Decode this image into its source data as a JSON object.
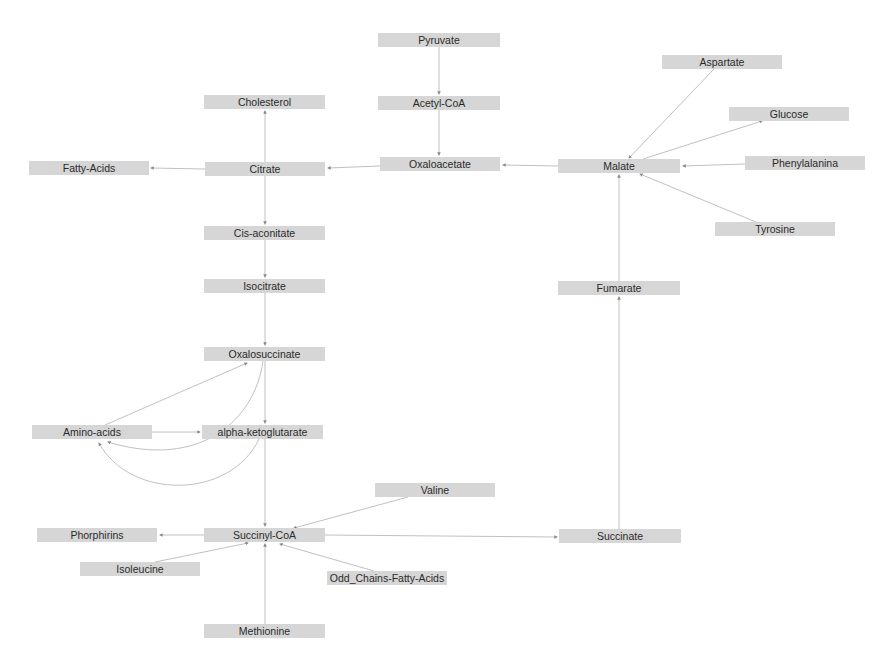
{
  "diagram": {
    "type": "metabolic-pathway-graph",
    "colors": {
      "node_fill": "#d6d6d6",
      "edge": "#b9b9b9",
      "text": "#2a2a2a",
      "background": "#ffffff"
    },
    "nodes": [
      {
        "id": "pyruvate",
        "label": "Pyruvate",
        "x": 378,
        "y": 33,
        "w": 122
      },
      {
        "id": "acetyl-coa",
        "label": "Acetyl-CoA",
        "x": 378,
        "y": 96,
        "w": 122
      },
      {
        "id": "oxaloacetate",
        "label": "Oxaloacetate",
        "x": 380,
        "y": 157,
        "w": 120
      },
      {
        "id": "cholesterol",
        "label": "Cholesterol",
        "x": 204,
        "y": 95,
        "w": 121
      },
      {
        "id": "citrate",
        "label": "Citrate",
        "x": 205,
        "y": 162,
        "w": 120
      },
      {
        "id": "fatty-acids",
        "label": "Fatty-Acids",
        "x": 29,
        "y": 161,
        "w": 120
      },
      {
        "id": "cis-aconitate",
        "label": "Cis-aconitate",
        "x": 204,
        "y": 226,
        "w": 121
      },
      {
        "id": "isocitrate",
        "label": "Isocitrate",
        "x": 204,
        "y": 279,
        "w": 121
      },
      {
        "id": "oxalosuccinate",
        "label": "Oxalosuccinate",
        "x": 204,
        "y": 347,
        "w": 121
      },
      {
        "id": "alpha-ketoglutarate",
        "label": "alpha-ketoglutarate",
        "x": 202,
        "y": 425,
        "w": 121
      },
      {
        "id": "amino-acids",
        "label": "Amino-acids",
        "x": 32,
        "y": 425,
        "w": 120
      },
      {
        "id": "succinyl-coa",
        "label": "Succinyl-CoA",
        "x": 204,
        "y": 528,
        "w": 121
      },
      {
        "id": "phorphirins",
        "label": "Phorphirins",
        "x": 37,
        "y": 528,
        "w": 120
      },
      {
        "id": "valine",
        "label": "Valine",
        "x": 375,
        "y": 483,
        "w": 120
      },
      {
        "id": "succinate",
        "label": "Succinate",
        "x": 559,
        "y": 529,
        "w": 122
      },
      {
        "id": "fumarate",
        "label": "Fumarate",
        "x": 558,
        "y": 281,
        "w": 122
      },
      {
        "id": "malate",
        "label": "Malate",
        "x": 558,
        "y": 159,
        "w": 122
      },
      {
        "id": "aspartate",
        "label": "Aspartate",
        "x": 662,
        "y": 55,
        "w": 120
      },
      {
        "id": "glucose",
        "label": "Glucose",
        "x": 729,
        "y": 107,
        "w": 120
      },
      {
        "id": "phenylalanina",
        "label": "Phenylalanina",
        "x": 745,
        "y": 156,
        "w": 120
      },
      {
        "id": "tyrosine",
        "label": "Tyrosine",
        "x": 715,
        "y": 222,
        "w": 120
      },
      {
        "id": "isoleucine",
        "label": "Isoleucine",
        "x": 80,
        "y": 562,
        "w": 120
      },
      {
        "id": "odd-chains-fatty-acids",
        "label": "Odd_Chains-Fatty-Acids",
        "x": 327,
        "y": 571,
        "w": 120
      },
      {
        "id": "methionine",
        "label": "Methionine",
        "x": 204,
        "y": 624,
        "w": 121
      }
    ],
    "edges": [
      {
        "from": "Pyruvate",
        "to": "Acetyl-CoA"
      },
      {
        "from": "Acetyl-CoA",
        "to": "Oxaloacetate"
      },
      {
        "from": "Oxaloacetate",
        "to": "Citrate"
      },
      {
        "from": "Citrate",
        "to": "Cholesterol"
      },
      {
        "from": "Citrate",
        "to": "Fatty-Acids"
      },
      {
        "from": "Citrate",
        "to": "Cis-aconitate"
      },
      {
        "from": "Cis-aconitate",
        "to": "Isocitrate"
      },
      {
        "from": "Isocitrate",
        "to": "Oxalosuccinate"
      },
      {
        "from": "Oxalosuccinate",
        "to": "alpha-ketoglutarate"
      },
      {
        "from": "Amino-acids",
        "to": "Oxalosuccinate"
      },
      {
        "from": "Amino-acids",
        "to": "alpha-ketoglutarate"
      },
      {
        "from": "Oxalosuccinate",
        "to": "Amino-acids"
      },
      {
        "from": "alpha-ketoglutarate",
        "to": "Amino-acids"
      },
      {
        "from": "alpha-ketoglutarate",
        "to": "Succinyl-CoA"
      },
      {
        "from": "Succinyl-CoA",
        "to": "Phorphirins"
      },
      {
        "from": "Valine",
        "to": "Succinyl-CoA"
      },
      {
        "from": "Isoleucine",
        "to": "Succinyl-CoA"
      },
      {
        "from": "Methionine",
        "to": "Succinyl-CoA"
      },
      {
        "from": "Odd_Chains-Fatty-Acids",
        "to": "Succinyl-CoA"
      },
      {
        "from": "Succinyl-CoA",
        "to": "Succinate"
      },
      {
        "from": "Succinate",
        "to": "Fumarate"
      },
      {
        "from": "Fumarate",
        "to": "Malate"
      },
      {
        "from": "Malate",
        "to": "Oxaloacetate"
      },
      {
        "from": "Aspartate",
        "to": "Malate"
      },
      {
        "from": "Malate",
        "to": "Glucose"
      },
      {
        "from": "Phenylalanina",
        "to": "Malate"
      },
      {
        "from": "Tyrosine",
        "to": "Malate"
      }
    ]
  }
}
